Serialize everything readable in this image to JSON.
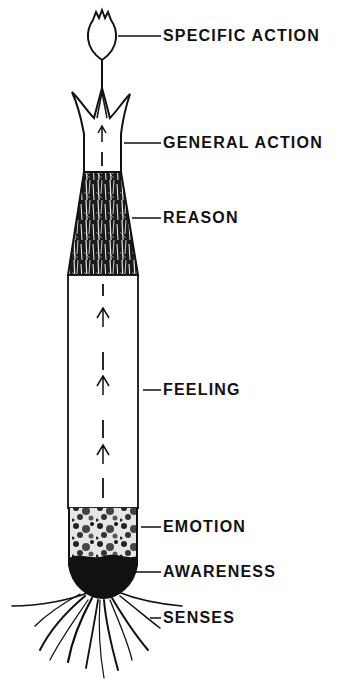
{
  "diagram": {
    "type": "plant-growth metaphor (bottom-up flow)",
    "flow_direction": "upward",
    "stages": [
      {
        "id": "specific-action",
        "label": "SPECIFIC ACTION",
        "part": "flower bud"
      },
      {
        "id": "general-action",
        "label": "GENERAL ACTION",
        "part": "crown / open sheath"
      },
      {
        "id": "reason",
        "label": "REASON",
        "part": "fibrous textured tapered section"
      },
      {
        "id": "feeling",
        "label": "FEELING",
        "part": "long white stalk with upward arrows"
      },
      {
        "id": "emotion",
        "label": "EMOTION",
        "part": "mottled section"
      },
      {
        "id": "awareness",
        "label": "AWARENESS",
        "part": "dark rounded base"
      },
      {
        "id": "senses",
        "label": "SENSES",
        "part": "roots"
      }
    ],
    "colors": {
      "ink": "#111111",
      "background": "#ffffff"
    }
  }
}
